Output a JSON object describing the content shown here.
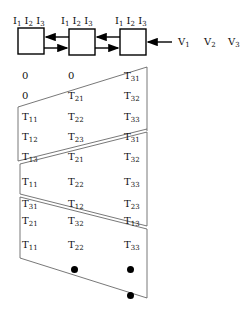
{
  "top_diagram": {
    "boxes": [
      {
        "labels": [
          "I",
          "I",
          "I"
        ],
        "subs": [
          "1",
          "2",
          "3"
        ]
      },
      {
        "labels": [
          "I",
          "I",
          "I"
        ],
        "subs": [
          "1",
          "2",
          "3"
        ]
      },
      {
        "labels": [
          "I",
          "I",
          "I"
        ],
        "subs": [
          "1",
          "2",
          "3"
        ]
      }
    ],
    "inputs": [
      {
        "label": "V",
        "sub": "1"
      },
      {
        "label": "V",
        "sub": "2"
      },
      {
        "label": "V",
        "sub": "3"
      }
    ]
  },
  "matrix": {
    "rows": [
      [
        {
          "t": "0",
          "s": ""
        },
        {
          "t": "0",
          "s": ""
        },
        {
          "t": "T",
          "s": "31"
        }
      ],
      [
        {
          "t": "0",
          "s": ""
        },
        {
          "t": "T",
          "s": "21"
        },
        {
          "t": "T",
          "s": "32"
        }
      ],
      [
        {
          "t": "T",
          "s": "11"
        },
        {
          "t": "T",
          "s": "22"
        },
        {
          "t": "T",
          "s": "33"
        }
      ],
      [
        {
          "t": "T",
          "s": "12"
        },
        {
          "t": "T",
          "s": "23"
        },
        {
          "t": "T",
          "s": "31"
        }
      ],
      [
        {
          "t": "T",
          "s": "13"
        },
        {
          "t": "T",
          "s": "21"
        },
        {
          "t": "T",
          "s": "32"
        }
      ],
      [
        {
          "t": "T",
          "s": "11"
        },
        {
          "t": "T",
          "s": "22"
        },
        {
          "t": "T",
          "s": "33"
        }
      ],
      [
        {
          "t": "T",
          "s": "31"
        },
        {
          "t": "T",
          "s": "12"
        },
        {
          "t": "T",
          "s": "23"
        }
      ],
      [
        {
          "t": "T",
          "s": "21"
        },
        {
          "t": "T",
          "s": "32"
        },
        {
          "t": "T",
          "s": "13"
        }
      ],
      [
        {
          "t": "T",
          "s": "11"
        },
        {
          "t": "T",
          "s": "22"
        },
        {
          "t": "T",
          "s": "33"
        }
      ]
    ],
    "continuation": "dots"
  }
}
